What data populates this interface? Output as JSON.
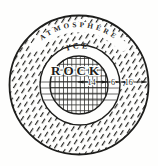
{
  "figure": {
    "type": "planet-interior-cross-section",
    "layers": [
      {
        "name": "atmosphere",
        "label": "ATMOSPHERE",
        "thickness": "16"
      },
      {
        "name": "ice",
        "label": "ICE",
        "thickness": "6"
      },
      {
        "name": "rock",
        "label": "ROCK",
        "thickness": "14"
      }
    ],
    "dimension_unit_note": "",
    "colors": {
      "ink": "#1d1d1b",
      "paper": "#fefefd"
    }
  }
}
